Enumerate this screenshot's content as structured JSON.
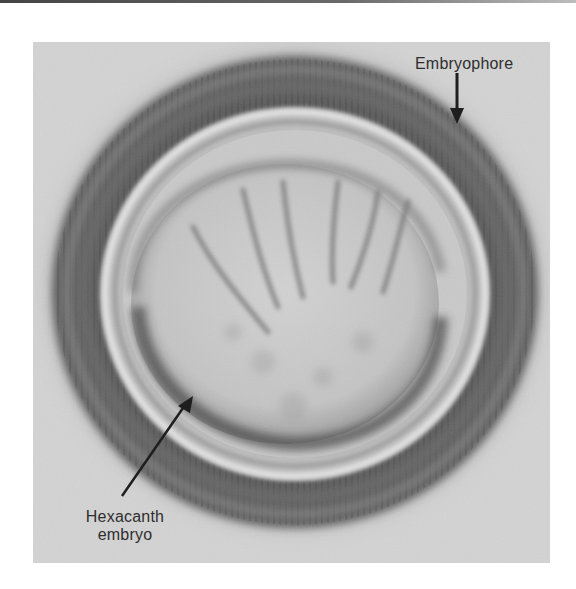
{
  "figure": {
    "colors": {
      "background": "#d3d3d3",
      "shell_dark": "#4a4a4a",
      "shell_mid": "#7a7a7a",
      "embryo_fill": "#c9c9c9",
      "label_text": "#2e2e2e"
    },
    "labels": {
      "embryophore": "Embryophore",
      "hexacanth_line1": "Hexacanth",
      "hexacanth_line2": "embryo"
    },
    "annotations": [
      {
        "label": "Embryophore",
        "arrow_from": [
          457,
          73
        ],
        "arrow_to": [
          457,
          122
        ]
      },
      {
        "label": "Hexacanth embryo",
        "arrow_from": [
          122,
          496
        ],
        "arrow_to": [
          189,
          398
        ]
      }
    ]
  }
}
